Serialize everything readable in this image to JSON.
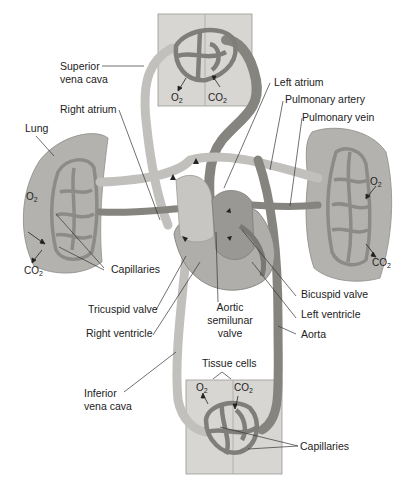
{
  "figure": {
    "colors": {
      "background": "#ffffff",
      "tissue": "#d8d6d2",
      "lung": "#b4b2ae",
      "deoxygenated_vessel": "#c2c0bc",
      "oxygenated_vessel": "#86847f",
      "label_text": "#222222"
    }
  },
  "labels": {
    "superior_vena_cava": [
      "Superior",
      "vena cava"
    ],
    "right_atrium": "Right atrium",
    "lung": "Lung",
    "left_atrium": "Left atrium",
    "pulmonary_artery": "Pulmonary artery",
    "pulmonary_vein": "Pulmonary vein",
    "capillaries_lung": "Capillaries",
    "tricuspid_valve": "Tricuspid valve",
    "right_ventricle": "Right ventricle",
    "aortic_semilunar_valve": [
      "Aortic",
      "semilunar",
      "valve"
    ],
    "bicuspid_valve": "Bicuspid valve",
    "left_ventricle": "Left ventricle",
    "aorta": "Aorta",
    "inferior_vena_cava": [
      "Inferior",
      "vena cava"
    ],
    "tissue_cells": "Tissue cells",
    "capillaries_tissue": "Capillaries"
  },
  "gases": {
    "o2": {
      "base": "O",
      "sub": "2"
    },
    "co2": {
      "base": "CO",
      "sub": "2"
    }
  }
}
